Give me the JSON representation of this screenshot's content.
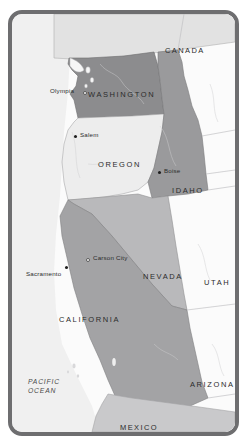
{
  "map": {
    "title": "Pacific Northwest and Western United States reference map",
    "frame": {
      "border_color": "#6e6e70",
      "background_color": "#f2f2f2"
    },
    "colors": {
      "ocean": "#f0f0f0",
      "land_plain": "#fcfcfc",
      "washington_fill": "#8c8c8e",
      "oregon_fill": "#ededed",
      "idaho_fill": "#9a9a9c",
      "california_fill": "#a3a3a5",
      "nevada_fill": "#b9b9bb",
      "canada_fill": "#e2e2e2",
      "mexico_fill": "#c9c9cb",
      "border_line": "#9a9a9c",
      "label_text": "#2b2b2b",
      "ocean_text": "#4a4a4a"
    },
    "countries": [
      {
        "id": "canada",
        "label": "CANADA",
        "x": 153,
        "y": 32
      },
      {
        "id": "mexico",
        "label": "MEXICO",
        "x": 108,
        "y": 409
      }
    ],
    "states": [
      {
        "id": "washington",
        "label": "WASHINGTON",
        "x": 76,
        "y": 76,
        "highlighted": true
      },
      {
        "id": "oregon",
        "label": "OREGON",
        "x": 86,
        "y": 146,
        "highlighted": false
      },
      {
        "id": "idaho",
        "label": "IDAHO",
        "x": 160,
        "y": 172,
        "highlighted": true
      },
      {
        "id": "nevada",
        "label": "NEVADA",
        "x": 131,
        "y": 258,
        "highlighted": true
      },
      {
        "id": "california",
        "label": "CALIFORNIA",
        "x": 47,
        "y": 301,
        "highlighted": true
      },
      {
        "id": "utah",
        "label": "UTAH",
        "x": 192,
        "y": 264,
        "highlighted": false
      },
      {
        "id": "arizona",
        "label": "ARIZONA",
        "x": 178,
        "y": 366,
        "highlighted": false
      }
    ],
    "oceans": [
      {
        "id": "pacific-ocean",
        "line1": "PACIFIC",
        "line2": "OCEAN",
        "x": 16,
        "y": 363
      }
    ],
    "cities": [
      {
        "id": "olympia",
        "label": "Olympia",
        "marker": "open",
        "marker_x": 71,
        "marker_y": 77,
        "label_x": 38,
        "label_y": 73,
        "label_align": "right"
      },
      {
        "id": "salem",
        "label": "Salem",
        "marker": "solid",
        "marker_x": 62,
        "marker_y": 121,
        "label_x": 68,
        "label_y": 117,
        "label_align": "left"
      },
      {
        "id": "boise",
        "label": "Boise",
        "marker": "solid",
        "marker_x": 146,
        "marker_y": 157,
        "label_x": 152,
        "label_y": 153,
        "label_align": "left"
      },
      {
        "id": "carson-city",
        "label": "Carson City",
        "marker": "open",
        "marker_x": 74,
        "marker_y": 244,
        "label_x": 81,
        "label_y": 240,
        "label_align": "left"
      },
      {
        "id": "sacramento",
        "label": "Sacramento",
        "marker": "solid",
        "marker_x": 53,
        "marker_y": 252,
        "label_x": 14,
        "label_y": 256,
        "label_align": "left"
      }
    ]
  }
}
